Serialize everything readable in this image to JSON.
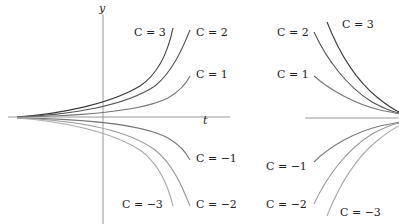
{
  "figure": {
    "left": {
      "title": "growth family y = C e^{kt}",
      "y_axis_label": "y",
      "t_axis_label": "t",
      "curves": [
        {
          "C": 3,
          "label": "C = 3",
          "color": "#3a3a3a"
        },
        {
          "C": 2,
          "label": "C = 2",
          "color": "#555555"
        },
        {
          "C": 1,
          "label": "C = 1",
          "color": "#777777"
        },
        {
          "C": -1,
          "label": "C = −1",
          "color": "#777777"
        },
        {
          "C": -2,
          "label": "C = −2",
          "color": "#999999"
        },
        {
          "C": -3,
          "label": "C = −3",
          "color": "#aaaaaa"
        }
      ]
    },
    "right": {
      "title": "decay family y = C e^{-kt}",
      "curves": [
        {
          "C": 3,
          "label": "C = 3",
          "color": "#3a3a3a"
        },
        {
          "C": 2,
          "label": "C = 2",
          "color": "#555555"
        },
        {
          "C": 1,
          "label": "C = 1",
          "color": "#777777"
        },
        {
          "C": -1,
          "label": "C = −1",
          "color": "#777777"
        },
        {
          "C": -2,
          "label": "C = −2",
          "color": "#999999"
        },
        {
          "C": -3,
          "label": "C = −3",
          "color": "#aaaaaa"
        }
      ]
    },
    "labels": {
      "y": "y",
      "t": "t",
      "left_c3": "C = 3",
      "left_c2": "C = 2",
      "left_c1": "C = 1",
      "left_cm1": "C = −1",
      "left_cm2": "C = −2",
      "left_cm3": "C = −3",
      "right_c3": "C = 3",
      "right_c2": "C = 2",
      "right_c1": "C = 1",
      "right_cm1": "C = −1",
      "right_cm2": "C = −2",
      "right_cm3": "C = −3"
    },
    "axis_color": "#999999"
  }
}
